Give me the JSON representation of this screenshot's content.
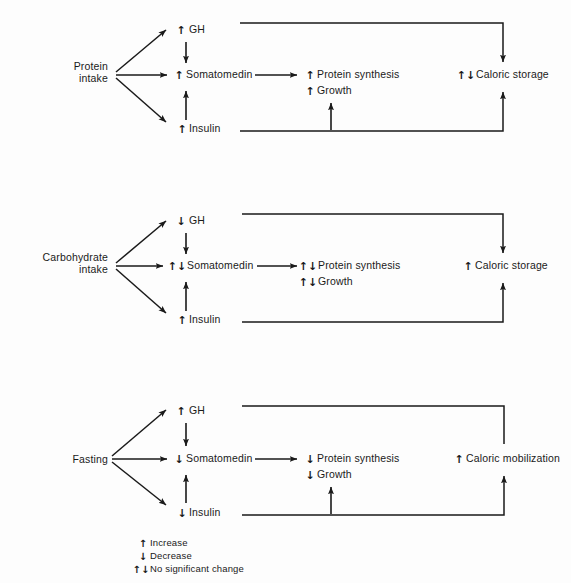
{
  "figure": {
    "type": "flow-diagram",
    "title": "",
    "background_color": "#fdfdfd",
    "line_color": "#1a1a1a"
  },
  "glyphs": {
    "increase": "↑",
    "decrease": "↓",
    "no_change": "↑↓"
  },
  "panels": [
    {
      "id": "protein",
      "source_label_line1": "Protein",
      "source_label_line2": "intake",
      "gh": {
        "glyph": "↑",
        "label": "GH"
      },
      "somatomedin": {
        "glyph": "↑",
        "label": "Somatomedin"
      },
      "insulin": {
        "glyph": "↑",
        "label": "Insulin"
      },
      "protein_synthesis": {
        "glyph": "↑",
        "label": "Protein synthesis"
      },
      "growth": {
        "glyph": "↑",
        "label": "Growth"
      },
      "outcome": {
        "glyph": "↑↓",
        "label": "Caloric storage"
      },
      "has_growth_branch": true,
      "top_line_arrowhead": true
    },
    {
      "id": "carbohydrate",
      "source_label_line1": "Carbohydrate",
      "source_label_line2": "intake",
      "gh": {
        "glyph": "↓",
        "label": "GH"
      },
      "somatomedin": {
        "glyph": "↑↓",
        "label": "Somatomedin"
      },
      "insulin": {
        "glyph": "↑",
        "label": "Insulin"
      },
      "protein_synthesis": {
        "glyph": "↑↓",
        "label": "Protein synthesis"
      },
      "growth": {
        "glyph": "↑↓",
        "label": "Growth"
      },
      "outcome": {
        "glyph": "↑",
        "label": "Caloric storage"
      },
      "has_growth_branch": false,
      "top_line_arrowhead": true
    },
    {
      "id": "fasting",
      "source_label_line1": "Fasting",
      "source_label_line2": "",
      "gh": {
        "glyph": "↑",
        "label": "GH"
      },
      "somatomedin": {
        "glyph": "↓",
        "label": "Somatomedin"
      },
      "insulin": {
        "glyph": "↓",
        "label": "Insulin"
      },
      "protein_synthesis": {
        "glyph": "↓",
        "label": "Protein synthesis"
      },
      "growth": {
        "glyph": "↓",
        "label": "Growth"
      },
      "outcome": {
        "glyph": "↑",
        "label": "Caloric mobilization"
      },
      "has_growth_branch": true,
      "top_line_arrowhead": false
    }
  ],
  "legend": {
    "items": [
      {
        "glyph": "↑",
        "label": "Increase"
      },
      {
        "glyph": "↓",
        "label": "Decrease"
      },
      {
        "glyph": "↑↓",
        "label": "No significant change"
      }
    ]
  }
}
